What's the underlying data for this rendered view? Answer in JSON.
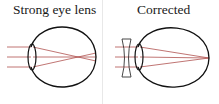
{
  "panels": [
    {
      "title": "Strong eye lens",
      "description": "Eye lens too strong; parallel rays focus in front of the retina"
    },
    {
      "title": "Corrected",
      "description": "Concave (diverging) lens placed before the eye; rays focus on the retina"
    }
  ],
  "colors": {
    "eye_outline": "#111111",
    "ray": "#b0524f",
    "divider": "#e8e8e8",
    "lens_outline": "#333333"
  },
  "icons": {
    "eye-left": "eye-diagram",
    "eye-right": "eye-diagram",
    "concave-lens": "diverging-lens"
  }
}
